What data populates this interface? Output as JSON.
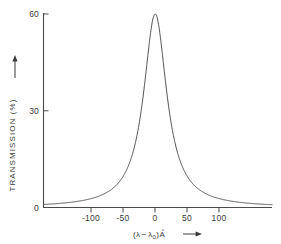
{
  "chart_data": {
    "type": "line",
    "title": "",
    "subtitle": "",
    "xlabel": "(λ - λ₀) Å",
    "ylabel": "TRANSMISSION (%)",
    "xlabel_parts": {
      "open_paren": "(",
      "lambda": "λ",
      "minus": "−",
      "lambda0_base": "λ",
      "lambda0_sub": "0",
      "close_paren": ")",
      "unit": "A",
      "unit_ring": "°",
      "arrow": "⟶"
    },
    "ylabel_arrow": "↑",
    "xlim": [
      -175,
      183
    ],
    "ylim": [
      0,
      63
    ],
    "xticks": [
      -100,
      -50,
      0,
      50,
      100
    ],
    "xticklabels": [
      "-100",
      "-50",
      "0",
      "50",
      "100"
    ],
    "yticks": [
      0,
      30,
      60
    ],
    "yticklabels": [
      "0",
      "30",
      "60"
    ],
    "grid": false,
    "legend": "none",
    "peak_value": 60,
    "peak_position": 0,
    "half_width_half_max": 22,
    "profile": "lorentzian",
    "series": [
      {
        "name": "transmission",
        "color": "#3d3d3d",
        "x": [
          -175,
          -170,
          -165,
          -160,
          -155,
          -150,
          -145,
          -140,
          -135,
          -130,
          -125,
          -120,
          -115,
          -110,
          -105,
          -100,
          -95,
          -90,
          -85,
          -80,
          -75,
          -70,
          -65,
          -60,
          -56,
          -52,
          -48,
          -44,
          -40,
          -37,
          -34,
          -31,
          -28,
          -25,
          -22,
          -19,
          -16,
          -13,
          -10,
          -7,
          -4,
          -2,
          0,
          2,
          4,
          7,
          10,
          13,
          16,
          19,
          22,
          25,
          28,
          31,
          34,
          37,
          40,
          44,
          48,
          52,
          56,
          60,
          65,
          70,
          75,
          80,
          85,
          90,
          95,
          100,
          105,
          110,
          115,
          120,
          125,
          130,
          135,
          140,
          145,
          150,
          155,
          160,
          165,
          170,
          175,
          180,
          183
        ],
        "y": [
          0.94,
          0.99,
          1.05,
          1.12,
          1.19,
          1.27,
          1.36,
          1.46,
          1.57,
          1.69,
          1.83,
          1.99,
          2.16,
          2.37,
          2.6,
          2.87,
          3.17,
          3.52,
          3.93,
          4.4,
          4.96,
          5.62,
          6.4,
          7.33,
          8.21,
          9.25,
          10.47,
          11.92,
          13.64,
          15.13,
          16.83,
          18.76,
          20.94,
          23.38,
          26.08,
          29.03,
          32.18,
          35.48,
          38.82,
          42.07,
          45.03,
          46.73,
          60.0,
          46.73,
          45.03,
          42.07,
          38.82,
          35.48,
          32.18,
          29.03,
          26.08,
          23.38,
          20.94,
          18.76,
          16.83,
          15.13,
          13.64,
          11.92,
          10.47,
          9.25,
          8.21,
          7.33,
          6.4,
          5.62,
          4.96,
          4.4,
          3.93,
          3.52,
          3.17,
          2.87,
          2.6,
          2.37,
          2.16,
          1.99,
          1.83,
          1.69,
          1.57,
          1.46,
          1.36,
          1.27,
          1.19,
          1.12,
          1.05,
          0.99,
          0.94,
          0.89,
          0.87
        ]
      }
    ]
  },
  "axes": {
    "y_axis_name": "transmission-axis",
    "x_axis_name": "wavelength-offset-axis"
  }
}
